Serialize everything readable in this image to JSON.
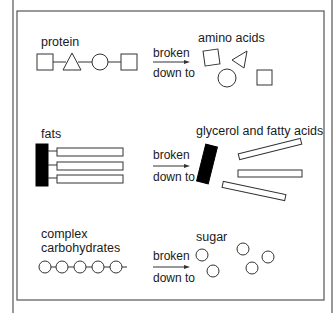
{
  "diagram": {
    "rows": [
      {
        "id": "protein",
        "input_label": "protein",
        "arrow_label_top": "broken",
        "arrow_label_bottom": "down to",
        "output_label": "amino acids"
      },
      {
        "id": "fats",
        "input_label": "fats",
        "arrow_label_top": "broken",
        "arrow_label_bottom": "down to",
        "output_label": "glycerol and fatty acids"
      },
      {
        "id": "carbohydrates",
        "input_label_line1": "complex",
        "input_label_line2": "carbohydrates",
        "arrow_label_top": "broken",
        "arrow_label_bottom": "down to",
        "output_label": "sugar"
      }
    ],
    "icons": {
      "protein_chain": "square-triangle-circle-square chain",
      "amino_acids": "separated square, triangle, circle, square",
      "fat_molecule": "black bar with three attached white bars",
      "glycerol_fatty_acids": "black bar with three detached white bars",
      "carbohydrate_chain": "chain of five circles",
      "sugars": "five separate circles"
    },
    "colors": {
      "line": "#333333",
      "frame": "#555555",
      "glycerol": "#000000",
      "background": "#ffffff"
    }
  }
}
